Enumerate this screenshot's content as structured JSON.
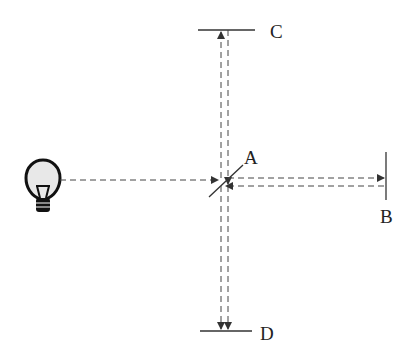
{
  "diagram": {
    "type": "Michelson interferometer schematic",
    "labels": {
      "A": "A",
      "B": "B",
      "C": "C",
      "D": "D"
    },
    "components": [
      {
        "id": "light-source",
        "kind": "light bulb"
      },
      {
        "id": "A",
        "kind": "beam splitter (diagonal)"
      },
      {
        "id": "B",
        "kind": "mirror (vertical, right)"
      },
      {
        "id": "C",
        "kind": "mirror (horizontal, top)"
      },
      {
        "id": "D",
        "kind": "detector/screen (horizontal, bottom)"
      }
    ],
    "colors": {
      "line": "#333333",
      "bulb_fill": "#e8e8e8"
    }
  }
}
